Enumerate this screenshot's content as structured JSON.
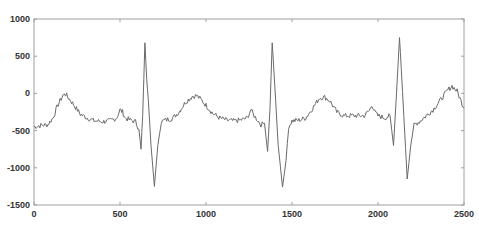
{
  "chart_data": {
    "type": "line",
    "title": "",
    "xlabel": "",
    "ylabel": "",
    "xlim": [
      0,
      2500
    ],
    "ylim": [
      -1500,
      1000
    ],
    "grid": false,
    "legend": null,
    "x_ticks": [
      0,
      500,
      1000,
      1500,
      2000,
      2500
    ],
    "y_ticks": [
      1000,
      500,
      0,
      -500,
      -1000,
      -1500
    ],
    "x_tick_labels": [
      "0",
      "500",
      "1000",
      "1500",
      "2000",
      "2500"
    ],
    "y_tick_labels": [
      "1000",
      "500",
      "0",
      "-500",
      "-1000",
      "-1500"
    ],
    "line_color": "#6a6a6a",
    "series": [
      {
        "name": "signal",
        "x": [
          0,
          40,
          80,
          110,
          140,
          170,
          185,
          200,
          230,
          270,
          310,
          350,
          400,
          440,
          480,
          500,
          515,
          530,
          560,
          590,
          610,
          622,
          632,
          645,
          655,
          665,
          680,
          700,
          720,
          740,
          760,
          800,
          840,
          880,
          920,
          945,
          970,
          1000,
          1040,
          1080,
          1120,
          1160,
          1200,
          1240,
          1260,
          1280,
          1300,
          1320,
          1340,
          1358,
          1372,
          1385,
          1395,
          1405,
          1420,
          1445,
          1465,
          1480,
          1500,
          1540,
          1580,
          1620,
          1660,
          1690,
          1720,
          1760,
          1800,
          1840,
          1880,
          1920,
          1950,
          1965,
          1980,
          2000,
          2040,
          2070,
          2090,
          2105,
          2125,
          2135,
          2150,
          2170,
          2190,
          2210,
          2240,
          2280,
          2320,
          2360,
          2400,
          2430,
          2460,
          2500
        ],
        "values": [
          -450,
          -430,
          -420,
          -330,
          -150,
          -20,
          -10,
          -60,
          -150,
          -280,
          -330,
          -370,
          -380,
          -370,
          -330,
          -220,
          -250,
          -330,
          -360,
          -380,
          -480,
          -750,
          -300,
          680,
          200,
          -100,
          -700,
          -1250,
          -700,
          -380,
          -360,
          -340,
          -260,
          -120,
          -40,
          -30,
          -80,
          -160,
          -270,
          -330,
          -360,
          -370,
          -360,
          -330,
          -220,
          -300,
          -360,
          -420,
          -400,
          -780,
          -200,
          680,
          300,
          -100,
          -700,
          -1260,
          -900,
          -450,
          -370,
          -360,
          -330,
          -200,
          -60,
          -50,
          -100,
          -250,
          -300,
          -300,
          -300,
          -300,
          -230,
          -150,
          -250,
          -300,
          -330,
          -300,
          -700,
          -100,
          750,
          350,
          -300,
          -1150,
          -700,
          -420,
          -380,
          -300,
          -220,
          -100,
          30,
          100,
          30,
          -200
        ]
      }
    ]
  }
}
